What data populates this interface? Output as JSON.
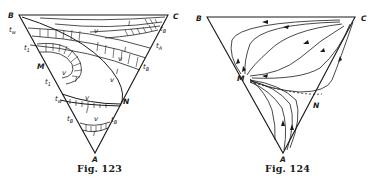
{
  "figures": [
    {
      "id": "fig123",
      "caption": "Fig. 123",
      "vertices": {
        "A": "A",
        "B": "B",
        "C": "C"
      },
      "points": {
        "M": "M",
        "N": "N"
      },
      "curve_labels": {
        "v": "v",
        "l": "l"
      },
      "t_labels": {
        "t_w_top": {
          "t": "t",
          "sub": "w"
        },
        "t_1_top": {
          "t": "t",
          "sub": "1"
        },
        "t_1_low": {
          "t": "t",
          "sub": "1"
        },
        "t_w_low": {
          "t": "t",
          "sub": "w"
        },
        "t_B_left": {
          "t": "t",
          "sub": "B"
        },
        "t_B_c": {
          "t": "t",
          "sub": "B"
        },
        "t_A": {
          "t": "t",
          "sub": "A"
        },
        "t_B_right": {
          "t": "t",
          "sub": "B"
        },
        "t_B_low_right": {
          "t": "t",
          "sub": "B"
        }
      }
    },
    {
      "id": "fig124",
      "caption": "Fig. 124",
      "vertices": {
        "A": "A",
        "B": "B",
        "C": "C"
      },
      "points": {
        "M": "M",
        "N": "N"
      }
    }
  ]
}
